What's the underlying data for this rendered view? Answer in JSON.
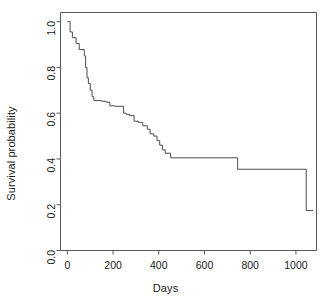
{
  "chart_data": {
    "type": "line",
    "subtype": "kaplan-meier-step",
    "title": "",
    "xlabel": "Days",
    "ylabel": "Survival probability",
    "xlim": [
      -30,
      1090
    ],
    "ylim": [
      0.0,
      1.04
    ],
    "grid": false,
    "legend": null,
    "line_color": "#4d4d4d",
    "line_width": 1,
    "background": "#ffffff",
    "xticks": [
      0,
      200,
      400,
      600,
      800,
      1000
    ],
    "xtick_labels": [
      "0",
      "200",
      "400",
      "600",
      "800",
      "1000"
    ],
    "yticks": [
      0.0,
      0.2,
      0.4,
      0.6,
      0.8,
      1.0
    ],
    "ytick_labels": [
      "0.0",
      "0.2",
      "0.4",
      "0.6",
      "0.8",
      "1.0"
    ],
    "ytick_label_rotation": -90,
    "tick_direction": "out",
    "x": [
      0,
      12,
      22,
      38,
      52,
      68,
      74,
      80,
      86,
      92,
      100,
      108,
      116,
      124,
      150,
      170,
      186,
      210,
      246,
      258,
      272,
      292,
      310,
      330,
      350,
      362,
      378,
      392,
      404,
      416,
      428,
      440,
      452,
      745,
      1045,
      1075
    ],
    "y": [
      1.0,
      1.0,
      0.955,
      0.93,
      0.905,
      0.878,
      0.878,
      0.85,
      0.8,
      0.755,
      0.73,
      0.7,
      0.672,
      0.655,
      0.652,
      0.648,
      0.632,
      0.63,
      0.628,
      0.6,
      0.595,
      0.59,
      0.565,
      0.56,
      0.545,
      0.53,
      0.51,
      0.5,
      0.48,
      0.46,
      0.44,
      0.425,
      0.405,
      0.405,
      0.355,
      0.175
    ],
    "steps": [
      {
        "day": 0,
        "survival": 1.0
      },
      {
        "day": 12,
        "survival": 0.955
      },
      {
        "day": 22,
        "survival": 0.93
      },
      {
        "day": 38,
        "survival": 0.905
      },
      {
        "day": 52,
        "survival": 0.878
      },
      {
        "day": 74,
        "survival": 0.85
      },
      {
        "day": 80,
        "survival": 0.8
      },
      {
        "day": 86,
        "survival": 0.755
      },
      {
        "day": 92,
        "survival": 0.73
      },
      {
        "day": 100,
        "survival": 0.7
      },
      {
        "day": 108,
        "survival": 0.672
      },
      {
        "day": 116,
        "survival": 0.655
      },
      {
        "day": 150,
        "survival": 0.652
      },
      {
        "day": 170,
        "survival": 0.648
      },
      {
        "day": 186,
        "survival": 0.632
      },
      {
        "day": 210,
        "survival": 0.63
      },
      {
        "day": 246,
        "survival": 0.6
      },
      {
        "day": 258,
        "survival": 0.595
      },
      {
        "day": 272,
        "survival": 0.59
      },
      {
        "day": 292,
        "survival": 0.565
      },
      {
        "day": 310,
        "survival": 0.56
      },
      {
        "day": 330,
        "survival": 0.545
      },
      {
        "day": 350,
        "survival": 0.53
      },
      {
        "day": 362,
        "survival": 0.51
      },
      {
        "day": 378,
        "survival": 0.5
      },
      {
        "day": 392,
        "survival": 0.48
      },
      {
        "day": 404,
        "survival": 0.46
      },
      {
        "day": 416,
        "survival": 0.44
      },
      {
        "day": 428,
        "survival": 0.425
      },
      {
        "day": 452,
        "survival": 0.405
      },
      {
        "day": 745,
        "survival": 0.355
      },
      {
        "day": 1045,
        "survival": 0.175
      }
    ]
  }
}
